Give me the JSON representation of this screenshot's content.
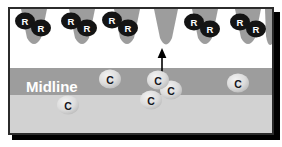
{
  "figure": {
    "labels": {
      "midline": "Midline",
      "receptor": "R",
      "cue": "C"
    },
    "colors": {
      "background": "#ffffff",
      "panel_top": "#ffffff",
      "midline_band": "#9d9d9d",
      "lower_region": "#d2d2d2",
      "cone_fill": "#9d9d9d",
      "receptor_fill": "#141414",
      "receptor_text": "#ffffff",
      "cue_fill": "#d9d9d9",
      "cue_text": "#15161a",
      "border": "#2b2b2b",
      "shadow": "#000000",
      "arrow": "#000000",
      "midline_text": "#ffffff"
    },
    "regions": [
      {
        "name": "upper-white-field",
        "y": 8,
        "height": 60,
        "fill": "#ffffff"
      },
      {
        "name": "midline-band",
        "y": 68,
        "height": 27,
        "fill": "#9d9d9d"
      },
      {
        "name": "lower-field",
        "y": 95,
        "height": 40,
        "fill": "#d2d2d2"
      }
    ],
    "cones": [
      {
        "id": "cone-1",
        "cx": 34,
        "top_width": 26,
        "tip_y": 48,
        "has_receptors": true
      },
      {
        "id": "cone-2",
        "cx": 82,
        "top_width": 26,
        "tip_y": 48,
        "has_receptors": true
      },
      {
        "id": "cone-3",
        "cx": 127,
        "top_width": 26,
        "tip_y": 48,
        "has_receptors": true
      },
      {
        "id": "cone-4",
        "cx": 166,
        "top_width": 24,
        "tip_y": 49,
        "has_receptors": false
      },
      {
        "id": "cone-5",
        "cx": 205,
        "top_width": 26,
        "tip_y": 48,
        "has_receptors": true
      },
      {
        "id": "cone-6",
        "cx": 248,
        "top_width": 26,
        "tip_y": 48,
        "has_receptors": true
      },
      {
        "id": "cone-7",
        "cx": 272,
        "top_width": 18,
        "tip_y": 46,
        "has_receptors": false
      }
    ],
    "receptors": [
      {
        "id": "receptor-1a",
        "cx": 25,
        "cy": 21,
        "rx": 10,
        "ry": 8.5,
        "label": "R"
      },
      {
        "id": "receptor-1b",
        "cx": 41,
        "cy": 28,
        "rx": 10,
        "ry": 8.5,
        "label": "R"
      },
      {
        "id": "receptor-2a",
        "cx": 71,
        "cy": 21,
        "rx": 10,
        "ry": 8.5,
        "label": "R"
      },
      {
        "id": "receptor-2b",
        "cx": 87,
        "cy": 28,
        "rx": 10,
        "ry": 8.5,
        "label": "R"
      },
      {
        "id": "receptor-3a",
        "cx": 112,
        "cy": 20,
        "rx": 10,
        "ry": 8.5,
        "label": "R"
      },
      {
        "id": "receptor-3b",
        "cx": 128,
        "cy": 28,
        "rx": 10,
        "ry": 8.5,
        "label": "R"
      },
      {
        "id": "receptor-5a",
        "cx": 194,
        "cy": 22,
        "rx": 10,
        "ry": 8.5,
        "label": "R"
      },
      {
        "id": "receptor-5b",
        "cx": 210,
        "cy": 29,
        "rx": 10,
        "ry": 8.5,
        "label": "R"
      },
      {
        "id": "receptor-6a",
        "cx": 240,
        "cy": 22,
        "rx": 10,
        "ry": 8.5,
        "label": "R"
      },
      {
        "id": "receptor-6b",
        "cx": 256,
        "cy": 29,
        "rx": 10,
        "ry": 8.5,
        "label": "R"
      }
    ],
    "cues": [
      {
        "id": "cue-left-upper",
        "cx": 110,
        "cy": 79,
        "rx": 11,
        "ry": 9.5,
        "label": "C"
      },
      {
        "id": "cue-left-lower",
        "cx": 68,
        "cy": 105,
        "rx": 11,
        "ry": 9.5,
        "label": "C"
      },
      {
        "id": "cue-center-upper",
        "cx": 158,
        "cy": 80,
        "rx": 11,
        "ry": 9.5,
        "label": "C"
      },
      {
        "id": "cue-center-right",
        "cx": 171,
        "cy": 90,
        "rx": 11,
        "ry": 9.5,
        "label": "C"
      },
      {
        "id": "cue-center-lower",
        "cx": 151,
        "cy": 100,
        "rx": 11,
        "ry": 9.5,
        "label": "C"
      },
      {
        "id": "cue-right",
        "cx": 238,
        "cy": 83,
        "rx": 11,
        "ry": 9.5,
        "label": "C"
      }
    ],
    "arrow": {
      "id": "guidance-arrow",
      "x": 162,
      "y_tail": 72,
      "y_head": 50,
      "label": ""
    },
    "midline_label": {
      "x": 26,
      "y": 87,
      "text": "Midline"
    }
  }
}
